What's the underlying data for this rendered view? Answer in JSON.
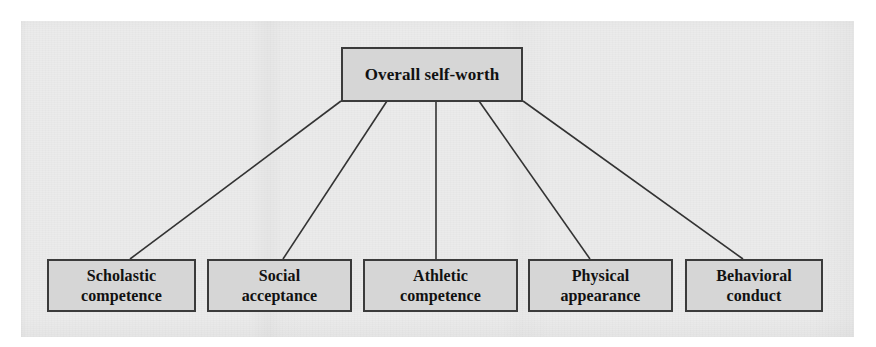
{
  "figure": {
    "type": "hierarchy-tree-diagram",
    "title_text": "Overall self-worth",
    "root": {
      "id": "overall-self-worth",
      "label": "Overall self-worth"
    },
    "children": [
      {
        "id": "scholastic-competence",
        "label": "Scholastic\ncompetence",
        "line1": "Scholastic",
        "line2": "competence"
      },
      {
        "id": "social-acceptance",
        "label": "Social\nacceptance",
        "line1": "Social",
        "line2": "acceptance"
      },
      {
        "id": "athletic-competence",
        "label": "Athletic\ncompetence",
        "line1": "Athletic",
        "line2": "competence"
      },
      {
        "id": "physical-appearance",
        "label": "Physical\nappearance",
        "line1": "Physical",
        "line2": "appearance"
      },
      {
        "id": "behavioral-conduct",
        "label": "Behavioral\nconduct",
        "line1": "Behavioral",
        "line2": "conduct"
      }
    ],
    "colors": {
      "box_fill": "#d6d6d6",
      "box_border": "#3b3b3b",
      "connector": "#333333",
      "text": "#111111",
      "page_background": "#ebebeb",
      "canvas_background": "#ffffff"
    },
    "connector_count": 5
  }
}
